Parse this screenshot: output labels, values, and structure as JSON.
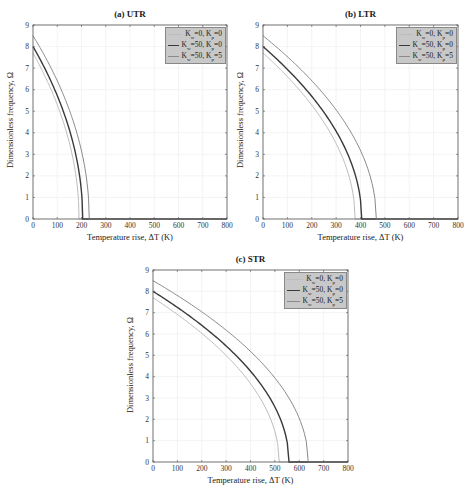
{
  "chart_data": [
    {
      "type": "line",
      "title": "(a) UTR",
      "xlabel": "Temperature rise, ΔT (K)",
      "ylabel": "Dimensionless frequency, Ω",
      "xlim": [
        0,
        800
      ],
      "ylim": [
        0,
        9
      ],
      "xticks": [
        0,
        100,
        200,
        300,
        400,
        500,
        600,
        700,
        800
      ],
      "yticks": [
        0,
        1,
        2,
        3,
        4,
        5,
        6,
        7,
        8,
        9
      ],
      "grid": true,
      "legend_position": "upper right",
      "series": [
        {
          "name": "Kw=0, Kp=0",
          "label_main": [
            "K",
            "w",
            "=0, K",
            "p",
            "=0"
          ],
          "color": "#bdbdbd",
          "width": 1,
          "omega0": 7.7,
          "critical_dT": 190,
          "x": [
            0,
            20,
            40,
            60,
            80,
            100,
            120,
            140,
            160,
            175,
            185,
            190,
            800
          ],
          "y": [
            7.7,
            7.29,
            6.85,
            6.38,
            5.87,
            5.31,
            4.68,
            3.95,
            3.06,
            2.16,
            1.25,
            0,
            0
          ]
        },
        {
          "name": "Kw=50, Kp=0",
          "label_main": [
            "K",
            "w",
            "=50, K",
            "p",
            "=0"
          ],
          "color": "#3a3a3a",
          "width": 1.4,
          "omega0": 8.0,
          "critical_dT": 205,
          "x": [
            0,
            20,
            40,
            60,
            80,
            100,
            120,
            140,
            160,
            180,
            195,
            205,
            800
          ],
          "y": [
            8.0,
            7.61,
            7.2,
            6.76,
            6.29,
            5.78,
            5.21,
            4.57,
            3.79,
            2.79,
            1.77,
            0,
            0
          ]
        },
        {
          "name": "Kw=50, Kp=5",
          "label_main": [
            "K",
            "w",
            "=50, K",
            "p",
            "=5"
          ],
          "color": "#8a8a8a",
          "width": 1,
          "omega0": 8.5,
          "critical_dT": 232,
          "x": [
            0,
            20,
            40,
            60,
            80,
            100,
            120,
            140,
            160,
            180,
            200,
            220,
            232,
            800
          ],
          "y": [
            8.5,
            8.14,
            7.72,
            7.3,
            6.86,
            6.38,
            5.86,
            5.33,
            4.73,
            4.03,
            3.15,
            1.94,
            0,
            0
          ]
        }
      ]
    },
    {
      "type": "line",
      "title": "(b) LTR",
      "xlabel": "Temperature rise, ΔT (K)",
      "ylabel": "Dimensionless frequency, Ω",
      "xlim": [
        0,
        800
      ],
      "ylim": [
        0,
        9
      ],
      "xticks": [
        0,
        100,
        200,
        300,
        400,
        500,
        600,
        700,
        800
      ],
      "yticks": [
        0,
        1,
        2,
        3,
        4,
        5,
        6,
        7,
        8,
        9
      ],
      "grid": true,
      "legend_position": "upper right",
      "series": [
        {
          "name": "Kw=0, Kp=0",
          "label_main": [
            "K",
            "w",
            "=0, K",
            "p",
            "=0"
          ],
          "color": "#bdbdbd",
          "width": 1,
          "omega0": 7.7,
          "critical_dT": 378,
          "x": [
            0,
            50,
            100,
            150,
            200,
            250,
            300,
            340,
            365,
            378,
            800
          ],
          "y": [
            7.7,
            7.18,
            6.62,
            5.99,
            5.28,
            4.46,
            3.48,
            2.45,
            1.43,
            0,
            0
          ]
        },
        {
          "name": "Kw=50, Kp=0",
          "label_main": [
            "K",
            "w",
            "=50, K",
            "p",
            "=0"
          ],
          "color": "#3a3a3a",
          "width": 1.4,
          "omega0": 8.0,
          "critical_dT": 405,
          "x": [
            0,
            50,
            100,
            150,
            200,
            250,
            300,
            350,
            390,
            405,
            800
          ],
          "y": [
            8.0,
            7.5,
            6.95,
            6.35,
            5.67,
            4.91,
            4.06,
            2.95,
            1.55,
            0,
            0
          ]
        },
        {
          "name": "Kw=50, Kp=5",
          "label_main": [
            "K",
            "w",
            "=50, K",
            "p",
            "=5"
          ],
          "color": "#8a8a8a",
          "width": 1,
          "omega0": 8.5,
          "critical_dT": 465,
          "x": [
            0,
            50,
            100,
            150,
            200,
            250,
            300,
            350,
            400,
            440,
            465,
            800
          ],
          "y": [
            8.5,
            8.03,
            7.53,
            6.99,
            6.42,
            5.79,
            5.11,
            4.34,
            3.36,
            1.99,
            0,
            0
          ]
        }
      ]
    },
    {
      "type": "line",
      "title": "(c) STR",
      "xlabel": "Temperature rise, ΔT (K)",
      "ylabel": "Dimensionless frequency, Ω",
      "xlim": [
        0,
        800
      ],
      "ylim": [
        0,
        9
      ],
      "xticks": [
        0,
        100,
        200,
        300,
        400,
        500,
        600,
        700,
        800
      ],
      "yticks": [
        0,
        1,
        2,
        3,
        4,
        5,
        6,
        7,
        8,
        9
      ],
      "grid": true,
      "legend_position": "upper right",
      "series": [
        {
          "name": "Kw=0, Kp=0",
          "label_main": [
            "K",
            "w",
            "=0, K",
            "p",
            "=0"
          ],
          "color": "#bdbdbd",
          "width": 1,
          "omega0": 7.7,
          "critical_dT": 518,
          "x": [
            0,
            50,
            100,
            150,
            200,
            250,
            300,
            350,
            400,
            450,
            490,
            510,
            518,
            800
          ],
          "y": [
            7.7,
            7.32,
            6.92,
            6.49,
            6.03,
            5.53,
            4.99,
            4.38,
            3.67,
            2.81,
            1.79,
            0.96,
            0,
            0
          ]
        },
        {
          "name": "Kw=50, Kp=0",
          "label_main": [
            "K",
            "w",
            "=50, K",
            "p",
            "=0"
          ],
          "color": "#3a3a3a",
          "width": 1.4,
          "omega0": 8.0,
          "critical_dT": 558,
          "x": [
            0,
            50,
            100,
            150,
            200,
            250,
            300,
            350,
            400,
            450,
            500,
            540,
            558,
            800
          ],
          "y": [
            8.0,
            7.63,
            7.25,
            6.84,
            6.41,
            5.95,
            5.44,
            4.89,
            4.26,
            3.52,
            2.58,
            1.44,
            0,
            0
          ]
        },
        {
          "name": "Kw=50, Kp=5",
          "label_main": [
            "K",
            "w",
            "=50, K",
            "p",
            "=5"
          ],
          "color": "#8a8a8a",
          "width": 1,
          "omega0": 8.5,
          "critical_dT": 637,
          "x": [
            0,
            50,
            100,
            150,
            200,
            250,
            300,
            350,
            400,
            450,
            500,
            550,
            600,
            625,
            637,
            800
          ],
          "y": [
            8.5,
            8.16,
            7.81,
            7.44,
            7.06,
            6.65,
            6.22,
            5.76,
            5.26,
            4.7,
            4.08,
            3.33,
            2.34,
            1.47,
            0,
            0
          ]
        }
      ]
    }
  ]
}
